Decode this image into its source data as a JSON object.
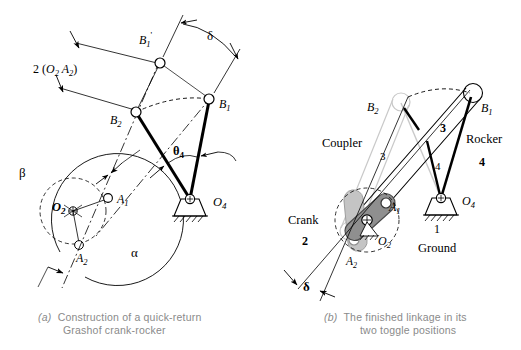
{
  "figure": {
    "background": "#ffffff",
    "ink": "#000000",
    "ghost": "#c9c9c9",
    "crank_fill": "#9a9a9a",
    "crank_fill_ghost": "#c0c0c0",
    "caption_color": "#8a8a8a"
  },
  "panel_a": {
    "caption_tag": "(a)",
    "caption_line1": "Construction of a quick-return",
    "caption_line2": "Grashof crank-rocker",
    "labels": {
      "b1_prime": "B",
      "b1_prime_sub": "1",
      "b1_prime_prime": "'",
      "b1": "B",
      "b1_sub": "1",
      "b2": "B",
      "b2_sub": "2",
      "a1": "A",
      "a1_sub": "1",
      "a2": "A",
      "a2_sub": "2",
      "o2": "O",
      "o2_sub": "2",
      "o4": "O",
      "o4_sub": "4",
      "theta4": "θ",
      "theta4_sub": "4",
      "delta": "δ",
      "alpha": "α",
      "beta": "β",
      "dim_two": "2 (",
      "dim_o2": "O",
      "dim_o2_sub": "2",
      "dim_a2": "A",
      "dim_a2_sub": "2",
      "dim_close": ")"
    }
  },
  "panel_b": {
    "caption_tag": "(b)",
    "caption_line1": "The finished linkage in its",
    "caption_line2": "two toggle positions",
    "labels": {
      "b1": "B",
      "b1_sub": "1",
      "b2": "B",
      "b2_sub": "2",
      "a1": "A",
      "a1_sub": "1",
      "a2": "A",
      "a2_sub": "2",
      "o2": "O",
      "o2_sub": "2",
      "o4": "O",
      "o4_sub": "4",
      "coupler": "Coupler",
      "coupler_num": "3",
      "coupler_num_ghost": "3",
      "rocker": "Rocker",
      "rocker_num": "4",
      "rocker_num_ghost": "4",
      "crank": "Crank",
      "crank_num": "2",
      "ground": "Ground",
      "ground_num": "1",
      "delta": "δ"
    }
  }
}
